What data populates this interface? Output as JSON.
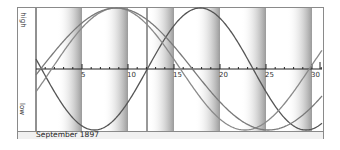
{
  "chart_data": {
    "type": "line",
    "month_label": "September 1897",
    "xlabel": "",
    "ylabel_top": "high",
    "ylabel_bottom": "low",
    "x_ticks": [
      5,
      10,
      15,
      20,
      25,
      30
    ],
    "x_range": [
      0,
      31
    ],
    "y_range": [
      -1,
      1
    ],
    "today_marker_day": 12,
    "grid": false,
    "shaded_bands_end_days": [
      5,
      10,
      15,
      20,
      25,
      30
    ],
    "shaded_band_width_days": 2.7,
    "series": [
      {
        "name": "physical",
        "period_days": 23,
        "zero_cross_up_day": 12.1,
        "color": "#555555",
        "width": 1.3
      },
      {
        "name": "emotional",
        "period_days": 28,
        "zero_cross_up_day": 1.7,
        "color": "#8a8a8a",
        "width": 1.3
      },
      {
        "name": "intellectual",
        "period_days": 33,
        "zero_cross_up_day": 0.5,
        "color": "#7a7a7a",
        "width": 1.3
      }
    ]
  },
  "labels": {
    "high": "high",
    "low": "low",
    "month": "September 1897"
  }
}
